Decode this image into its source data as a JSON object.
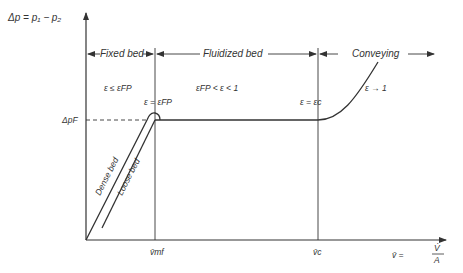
{
  "diagram": {
    "y_axis_label": "Δp = p₁ − p₂",
    "x_axis_label_lhs": "v̄ =",
    "x_axis_label_num": "V̇",
    "x_axis_label_den": "A",
    "regimes": [
      {
        "label": "Fixed bed"
      },
      {
        "label": "Fluidized bed"
      },
      {
        "label": "Conveying"
      }
    ],
    "conditions": {
      "fixed": "ε ≤ ε_FP",
      "fixed_display": "ε ≤ εFP",
      "fluidized": "εFP < ε < 1",
      "at_mf": "ε = εFP",
      "at_c": "ε = εc",
      "conveying": "ε → 1"
    },
    "y_marks": {
      "dp_f": "ΔpF"
    },
    "x_marks": {
      "v_mf": "v̄mf",
      "v_c": "v̄c"
    },
    "curve_labels": {
      "dense": "Dense bed",
      "loose": "Loose bed"
    },
    "colors": {
      "line": "#333333",
      "text": "#333333"
    }
  }
}
